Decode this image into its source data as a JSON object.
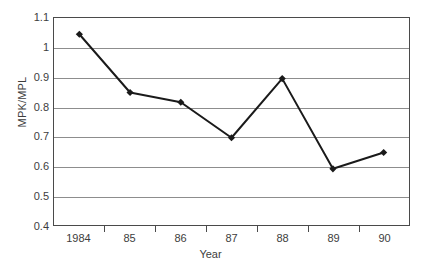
{
  "chart_data": {
    "type": "line",
    "title": "",
    "subtitle": "",
    "xlabel": "Year",
    "ylabel": "MPK/MPL",
    "categories": [
      "1984",
      "85",
      "86",
      "87",
      "88",
      "89",
      "90"
    ],
    "values": [
      1.045,
      0.848,
      0.815,
      0.695,
      0.895,
      0.59,
      0.645
    ],
    "series": [
      {
        "name": "MPK/MPL",
        "values": [
          1.045,
          0.848,
          0.815,
          0.695,
          0.895,
          0.59,
          0.645
        ]
      }
    ],
    "ylim": [
      0.4,
      1.1
    ],
    "ytick_labels": [
      "1.1",
      "1",
      "0.9",
      "0.8",
      "0.7",
      "0.6",
      "0.5",
      "0.4"
    ],
    "ytick_values": [
      1.1,
      1.0,
      0.9,
      0.8,
      0.7,
      0.6,
      0.5,
      0.4
    ],
    "ytick_step": 0.1,
    "grid": "horizontal",
    "legend": "none",
    "legend_position": "",
    "marker": "diamond",
    "line_color": "#1a1a1a",
    "marker_color": "#1a1a1a",
    "grid_color": "#8d8d8d",
    "axis_color": "#4a4a4a",
    "background_color": "#ffffff",
    "annotations": []
  }
}
